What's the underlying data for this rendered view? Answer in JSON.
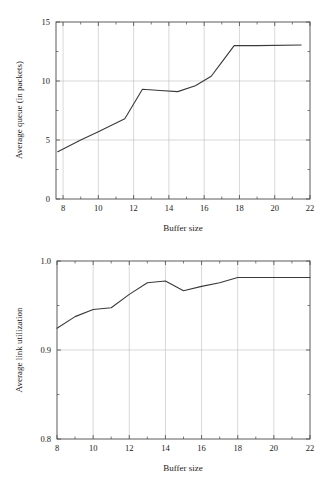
{
  "page": {
    "background": "#ffffff",
    "line_color": "#3a3a3a",
    "grid_color": "#bdbdbd",
    "axis_color": "#4a4a4a"
  },
  "chart_data": [
    {
      "id": "average-queue",
      "type": "line",
      "title": "",
      "xlabel": "Buffer size",
      "ylabel": "Average queue (in packets)",
      "xlim": [
        7.6,
        22.0
      ],
      "ylim": [
        0,
        15
      ],
      "xticks": [
        8,
        10,
        12,
        14,
        16,
        18,
        20,
        22
      ],
      "xticklabels": [
        "8",
        "10",
        "12",
        "14",
        "16",
        "18",
        "20",
        "22"
      ],
      "yticks": [
        0,
        5,
        10,
        15
      ],
      "yticklabels": [
        "0",
        "5",
        "10",
        "15"
      ],
      "xminorticks": [
        9,
        11,
        13,
        15,
        17,
        19,
        21
      ],
      "yminorticks": [
        2.5,
        7.5,
        12.5
      ],
      "grid": true,
      "grid_axes": "both",
      "legend": "none",
      "series": [
        {
          "name": "average queue",
          "x": [
            7.7,
            9.0,
            10.0,
            11.5,
            12.5,
            13.5,
            14.5,
            15.5,
            16.4,
            17.0,
            17.7,
            19.0,
            21.5
          ],
          "values": [
            4.0,
            5.0,
            5.7,
            6.8,
            9.3,
            9.2,
            9.1,
            9.6,
            10.4,
            11.6,
            13.0,
            13.0,
            13.05
          ]
        }
      ]
    },
    {
      "id": "average-link-utilization",
      "type": "line",
      "title": "",
      "xlabel": "Buffer size",
      "ylabel": "Average link utilization",
      "xlim": [
        8,
        22
      ],
      "ylim": [
        0.8,
        1.0
      ],
      "xticks": [
        8,
        10,
        12,
        14,
        16,
        18,
        20,
        22
      ],
      "xticklabels": [
        "8",
        "10",
        "12",
        "14",
        "16",
        "18",
        "20",
        "22"
      ],
      "yticks": [
        0.8,
        0.9,
        1.0
      ],
      "yticklabels": [
        "0.8",
        "0.9",
        "1.0"
      ],
      "xminorticks": [
        9,
        11,
        13,
        15,
        17,
        19,
        21
      ],
      "yminorticks": [
        0.85,
        0.95
      ],
      "grid": true,
      "grid_axes": "both",
      "legend": "none",
      "series": [
        {
          "name": "average link utilization",
          "x": [
            8,
            9,
            10,
            11,
            12,
            13,
            14,
            15,
            16,
            17,
            18,
            20,
            22
          ],
          "values": [
            0.9245,
            0.9375,
            0.9455,
            0.9475,
            0.9625,
            0.9755,
            0.9775,
            0.9665,
            0.9715,
            0.9755,
            0.9815,
            0.9815,
            0.9815
          ]
        }
      ]
    }
  ]
}
